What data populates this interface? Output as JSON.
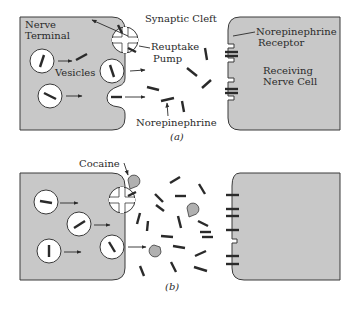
{
  "panel_a": {
    "caption": "(a)",
    "labels": {
      "nerve_terminal_1": "Nerve",
      "nerve_terminal_2": "Terminal",
      "synaptic_cleft": "Synaptic Cleft",
      "reuptake_1": "Reuptake",
      "reuptake_2": "Pump",
      "vesicles": "Vesicles",
      "norepinephrine": "Norepinephrine",
      "receptor_1": "Norepinephrine",
      "receptor_2": "Receptor",
      "receiving_1": "Receiving",
      "receiving_2": "Nerve Cell"
    }
  },
  "panel_b": {
    "caption": "(b)",
    "labels": {
      "cocaine": "Cocaine"
    }
  },
  "colors": {
    "cell_fill": "#c8c8c8",
    "outline": "#3a3a3a",
    "cocaine_fill": "#b0b0b0"
  }
}
